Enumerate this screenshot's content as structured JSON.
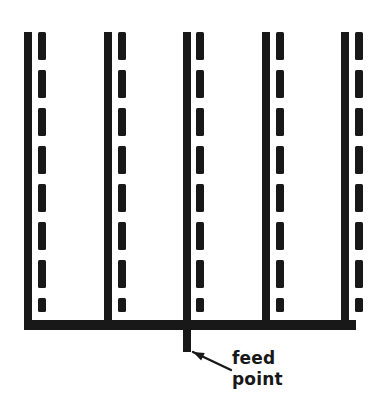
{
  "figure": {
    "background_color": "#ffffff",
    "ink_color": "#181818",
    "width": 378,
    "height": 410
  },
  "annotation": {
    "feed_label_line1": "feed",
    "feed_label_line2": "point",
    "label_x": 232,
    "label_line1_y": 364,
    "label_line2_y": 385,
    "leader_from_x": 231,
    "leader_from_y": 370,
    "leader_to_x": 193,
    "leader_to_y": 352
  },
  "geometry": {
    "solid_bar_width": 8,
    "dashed_bar_width": 8,
    "solid_bar_top": 32,
    "dashed_bar_top": 32,
    "solid_bar_bottom": 330,
    "dashed_bar_bottom": 312,
    "bus_y_top": 320,
    "bus_y_bottom": 330,
    "bus_x_left": 24,
    "bus_x_right": 348,
    "dash_length": 28,
    "dash_gap": 10,
    "dash_count": 8,
    "feed_stub_x": 183,
    "feed_stub_width": 8,
    "feed_stub_top": 330,
    "feed_stub_bottom": 352
  },
  "elements": {
    "solid_bars": [
      {
        "name": "solid-bar-1",
        "x": 24
      },
      {
        "name": "solid-bar-2",
        "x": 104
      },
      {
        "name": "solid-bar-3",
        "x": 183
      },
      {
        "name": "solid-bar-4",
        "x": 262
      },
      {
        "name": "solid-bar-5",
        "x": 341
      }
    ],
    "dashed_bars": [
      {
        "name": "dashed-bar-1",
        "x": 38
      },
      {
        "name": "dashed-bar-2",
        "x": 118
      },
      {
        "name": "dashed-bar-3",
        "x": 196
      },
      {
        "name": "dashed-bar-4",
        "x": 276
      },
      {
        "name": "dashed-bar-5",
        "x": 355
      }
    ]
  }
}
